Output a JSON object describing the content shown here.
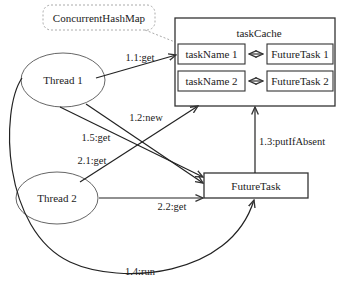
{
  "callout": {
    "label": "ConcurrentHashMap"
  },
  "cache": {
    "title": "taskCache",
    "entries": [
      {
        "key": "taskName 1",
        "value": "FutureTask 1"
      },
      {
        "key": "taskName 2",
        "value": "FutureTask 2"
      }
    ]
  },
  "threads": [
    {
      "label": "Thread 1"
    },
    {
      "label": "Thread 2"
    }
  ],
  "future_task": {
    "label": "FutureTask"
  },
  "edges": {
    "e11": "1.1:get",
    "e12": "1.2:new",
    "e13": "1.3:putIfAbsent",
    "e14": "1.4:run",
    "e15": "1.5:get",
    "e21": "2.1:get",
    "e22": "2.2:get"
  },
  "colors": {
    "stroke": "#333333",
    "callout_stroke": "#aaaaaa",
    "text": "#222222"
  }
}
